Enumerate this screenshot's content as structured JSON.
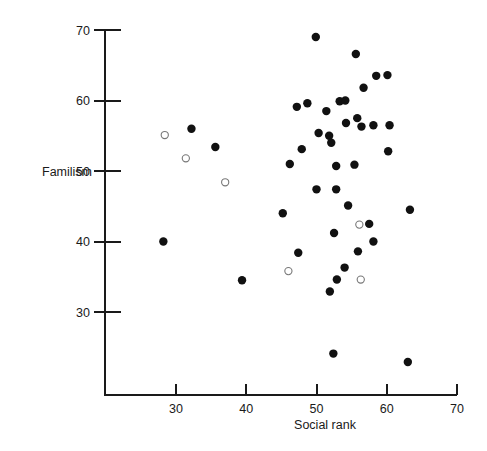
{
  "chart": {
    "title": "",
    "xlabel": "Social rank",
    "ylabel": "Familism"
  },
  "axes": {
    "x_ticks": [
      "30",
      "40",
      "50",
      "60",
      "70"
    ],
    "y_ticks": [
      "30",
      "40",
      "50",
      "60",
      "70"
    ]
  },
  "chart_data": {
    "type": "scatter",
    "title": "",
    "xlabel": "Social rank",
    "ylabel": "Familism",
    "xlim": [
      24.5,
      70
    ],
    "ylim": [
      22.5,
      70
    ],
    "xticks": [
      30,
      40,
      50,
      60,
      70
    ],
    "yticks": [
      30,
      40,
      50,
      60,
      70
    ],
    "grid": false,
    "legend": null,
    "series": [
      {
        "name": "filled",
        "marker": "filled-circle",
        "color": "#111111",
        "points": [
          [
            32.2,
            56.0
          ],
          [
            35.6,
            53.4
          ],
          [
            28.2,
            40.0
          ],
          [
            49.9,
            69.0
          ],
          [
            55.6,
            66.6
          ],
          [
            58.5,
            63.5
          ],
          [
            60.1,
            63.6
          ],
          [
            56.7,
            61.8
          ],
          [
            48.7,
            59.6
          ],
          [
            53.3,
            59.9
          ],
          [
            47.2,
            59.1
          ],
          [
            51.4,
            58.5
          ],
          [
            54.2,
            56.8
          ],
          [
            55.8,
            57.5
          ],
          [
            56.4,
            56.3
          ],
          [
            58.1,
            56.5
          ],
          [
            60.4,
            56.5
          ],
          [
            54.1,
            60.0
          ],
          [
            50.3,
            55.4
          ],
          [
            51.8,
            55.0
          ],
          [
            52.1,
            54.0
          ],
          [
            47.9,
            53.1
          ],
          [
            60.2,
            52.8
          ],
          [
            46.2,
            51.0
          ],
          [
            52.8,
            50.7
          ],
          [
            55.4,
            50.9
          ],
          [
            52.8,
            47.4
          ],
          [
            50.0,
            47.4
          ],
          [
            54.5,
            45.1
          ],
          [
            63.3,
            44.5
          ],
          [
            45.2,
            44.0
          ],
          [
            57.5,
            42.5
          ],
          [
            58.1,
            40.0
          ],
          [
            52.5,
            41.2
          ],
          [
            47.4,
            38.4
          ],
          [
            55.9,
            38.6
          ],
          [
            54.0,
            36.3
          ],
          [
            52.9,
            34.6
          ],
          [
            51.9,
            32.9
          ],
          [
            39.4,
            34.5
          ],
          [
            52.4,
            24.1
          ],
          [
            63.0,
            22.9
          ]
        ]
      },
      {
        "name": "open",
        "marker": "open-circle",
        "color": "#ffffff",
        "points": [
          [
            28.4,
            55.1
          ],
          [
            31.4,
            51.8
          ],
          [
            37.0,
            48.4
          ],
          [
            56.1,
            42.4
          ],
          [
            46.0,
            35.8
          ],
          [
            56.3,
            34.6
          ]
        ]
      }
    ]
  }
}
